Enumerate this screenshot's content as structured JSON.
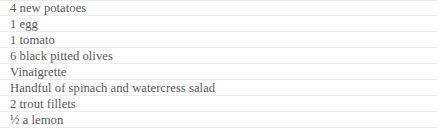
{
  "panel": {
    "name": "ingredients-list",
    "background_color": "#ffffff",
    "divider_color": "#ececef",
    "text_color": "#58585d"
  },
  "ingredients": {
    "items": [
      {
        "text": "4 new potatoes"
      },
      {
        "text": "1 egg"
      },
      {
        "text": "1 tomato"
      },
      {
        "text": "6 black pitted olives"
      },
      {
        "text": "Vinaigrette"
      },
      {
        "text": "Handful of spinach and watercress salad"
      },
      {
        "text": "2 trout fillets"
      },
      {
        "text": "½ a lemon"
      }
    ]
  }
}
